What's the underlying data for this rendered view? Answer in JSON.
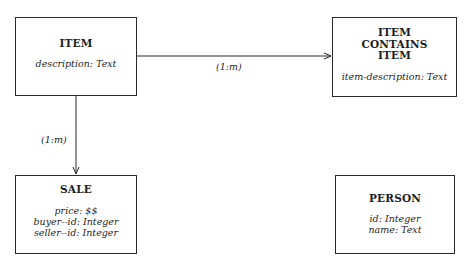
{
  "diagram": {
    "type": "entity-relationship",
    "entities": [
      {
        "id": "item",
        "name": "ITEM",
        "name_lines": [
          "ITEM"
        ],
        "attributes": [
          "description: Text"
        ]
      },
      {
        "id": "item-contains-item",
        "name": "ITEM CONTAINS ITEM",
        "name_lines": [
          "ITEM",
          "CONTAINS",
          "ITEM"
        ],
        "attributes": [
          "item-description: Text"
        ]
      },
      {
        "id": "sale",
        "name": "SALE",
        "name_lines": [
          "SALE"
        ],
        "attributes": [
          "price: $$",
          "buyer--id: Integer",
          "seller--id: Integer"
        ]
      },
      {
        "id": "person",
        "name": "PERSON",
        "name_lines": [
          "PERSON"
        ],
        "attributes": [
          "id: Integer",
          "name: Text"
        ]
      }
    ],
    "relationships": [
      {
        "from": "item",
        "to": "item-contains-item",
        "cardinality": "(1:m)"
      },
      {
        "from": "item",
        "to": "sale",
        "cardinality": "(1:m)"
      }
    ],
    "colors": {
      "line": "#2a2a2a",
      "text": "#1e1e1e",
      "background": "#ffffff"
    }
  }
}
